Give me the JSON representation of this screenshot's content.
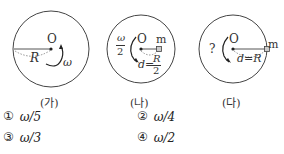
{
  "figures": [
    {
      "label": "(가)",
      "center": "O",
      "radius_label": "R",
      "angular_label": "ω"
    },
    {
      "label": "(나)",
      "center": "O",
      "mass_label": "m",
      "angular_label_num": "ω",
      "angular_label_den": "2",
      "distance_label": "d=",
      "distance_num": "R",
      "distance_den": "2"
    },
    {
      "label": "(다)",
      "center": "O",
      "mass_label": "m",
      "angular_label": "?",
      "distance_label": "d=R"
    }
  ],
  "options": [
    {
      "number": "①",
      "value": "ω/5"
    },
    {
      "number": "②",
      "value": "ω/4"
    },
    {
      "number": "③",
      "value": "ω/3"
    },
    {
      "number": "④",
      "value": "ω/2"
    }
  ]
}
